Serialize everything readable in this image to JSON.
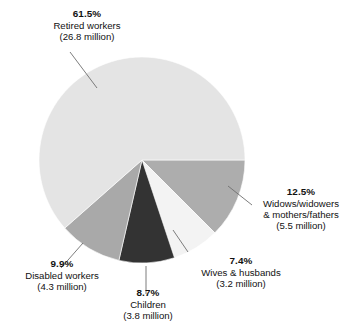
{
  "chart_data": {
    "type": "pie",
    "title": "",
    "subtitle": "",
    "xlabel": "",
    "ylabel": "",
    "legend_position": "none",
    "grid": false,
    "units": "percent of beneficiaries",
    "value_unit": "million people",
    "start_angle_deg": 0,
    "direction": "clockwise",
    "categories": [
      "Widows/widowers & mothers/fathers",
      "Wives & husbands",
      "Children",
      "Disabled workers",
      "Retired workers"
    ],
    "values": [
      12.5,
      7.4,
      8.7,
      9.9,
      61.5
    ],
    "counts_millions": [
      5.5,
      3.2,
      3.8,
      4.3,
      26.8
    ],
    "slices": [
      {
        "key": "widows",
        "percent_label": "12.5%",
        "percent": 12.5,
        "name_lines": [
          "Widows/widowers",
          "& mothers/fathers"
        ],
        "count_label": "(5.5 million)",
        "count": 5.5,
        "color": "#adadad",
        "start_deg": 0,
        "end_deg": 45
      },
      {
        "key": "wives",
        "percent_label": "7.4%",
        "percent": 7.4,
        "name_lines": [
          "Wives & husbands"
        ],
        "count_label": "(3.2 million)",
        "count": 3.2,
        "color": "#f3f3f3",
        "start_deg": 45,
        "end_deg": 71.64
      },
      {
        "key": "children",
        "percent_label": "8.7%",
        "percent": 8.7,
        "name_lines": [
          "Children"
        ],
        "count_label": "(3.8 million)",
        "count": 3.8,
        "color": "#333333",
        "start_deg": 71.64,
        "end_deg": 102.96
      },
      {
        "key": "disabled",
        "percent_label": "9.9%",
        "percent": 9.9,
        "name_lines": [
          "Disabled workers"
        ],
        "count_label": "(4.3 million)",
        "count": 4.3,
        "color": "#a9a9a9",
        "start_deg": 102.96,
        "end_deg": 138.6
      },
      {
        "key": "retired",
        "percent_label": "61.5%",
        "percent": 61.5,
        "name_lines": [
          "Retired workers"
        ],
        "count_label": "(26.8 million)",
        "count": 26.8,
        "color": "#e4e4e4",
        "start_deg": 138.6,
        "end_deg": 360
      }
    ]
  },
  "labels": {
    "retired": {
      "percent": "61.5%",
      "line1": "Retired workers",
      "line2": "(26.8 million)"
    },
    "widows": {
      "percent": "12.5%",
      "line1": "Widows/widowers",
      "line2": "& mothers/fathers",
      "line3": "(5.5 million)"
    },
    "wives": {
      "percent": "7.4%",
      "line1": "Wives & husbands",
      "line2": "(3.2 million)"
    },
    "children": {
      "percent": "8.7%",
      "line1": "Children",
      "line2": "(3.8 million)"
    },
    "disabled": {
      "percent": "9.9%",
      "line1": "Disabled workers",
      "line2": "(4.3 million)"
    }
  },
  "colors": {
    "background": "#ffffff",
    "text": "#111111",
    "leader_line": "#6e6e6e",
    "slice_retired": "#e4e4e4",
    "slice_widows": "#adadad",
    "slice_wives": "#f3f3f3",
    "slice_children": "#333333",
    "slice_disabled": "#a9a9a9"
  }
}
